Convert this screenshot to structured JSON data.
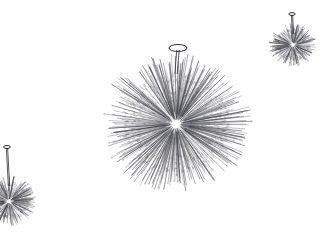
{
  "image": {
    "kind": "line-art-illustration",
    "subject": "sputnik starburst chandeliers",
    "width": 321,
    "height": 237,
    "background_color": "#ffffff",
    "stroke_color": "#555560",
    "stroke_color_dark": "#2e2e36",
    "stroke_color_light": "#9a9aa4",
    "has_text": false,
    "has_border": false,
    "caption": ""
  },
  "fixtures": [
    {
      "name": "main-chandelier",
      "role": "foreground-center",
      "center_x": 176,
      "center_y": 124,
      "core_radius": 16,
      "body_radius": 52,
      "spike_max_length": 78,
      "spike_count": 520,
      "tick_count": 900,
      "stem": {
        "canopy_center_x": 178,
        "canopy_center_y": 48,
        "canopy_rx": 9,
        "canopy_ry": 3.5,
        "stem_top_y": 50,
        "stem_bottom_y": 74,
        "stem_width": 2.4
      },
      "seed": 1873
    },
    {
      "name": "upper-right-chandelier",
      "role": "background-small",
      "center_x": 293,
      "center_y": 45,
      "core_radius": 6,
      "body_radius": 16,
      "spike_max_length": 24,
      "spike_count": 190,
      "tick_count": 260,
      "stem": {
        "canopy_center_x": 292,
        "canopy_center_y": 14,
        "canopy_rx": 3.2,
        "canopy_ry": 1.4,
        "stem_top_y": 15,
        "stem_bottom_y": 34,
        "stem_width": 1.2
      },
      "seed": 4409
    },
    {
      "name": "lower-left-chandelier",
      "role": "background-small-cropped",
      "center_x": 9,
      "center_y": 201,
      "core_radius": 7,
      "body_radius": 18,
      "spike_max_length": 28,
      "spike_count": 200,
      "tick_count": 280,
      "stem": {
        "canopy_center_x": 7,
        "canopy_center_y": 147,
        "canopy_rx": 3.4,
        "canopy_ry": 1.5,
        "stem_top_y": 148,
        "stem_bottom_y": 186,
        "stem_width": 1.3
      },
      "seed": 7721
    }
  ]
}
